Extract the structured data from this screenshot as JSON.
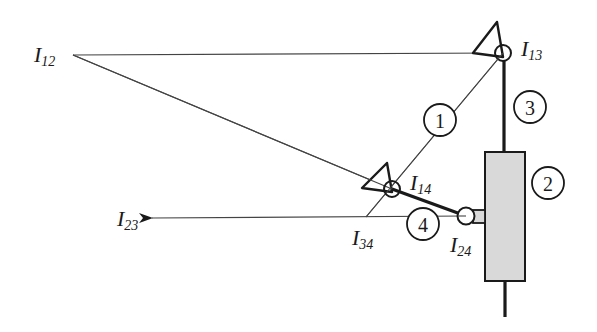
{
  "diagram": {
    "type": "slider-crank instant centers (Kennedy) diagram",
    "colors": {
      "stroke": "#1a1a1a",
      "thin_line": "#444444",
      "slider_fill": "#d9d9d9",
      "background": "#ffffff"
    },
    "instant_centers": [
      {
        "id": "I12",
        "main": "I",
        "sub": "12"
      },
      {
        "id": "I13",
        "main": "I",
        "sub": "13"
      },
      {
        "id": "I14",
        "main": "I",
        "sub": "14"
      },
      {
        "id": "I23",
        "main": "I",
        "sub": "23"
      },
      {
        "id": "I24",
        "main": "I",
        "sub": "24"
      },
      {
        "id": "I34",
        "main": "I",
        "sub": "34"
      }
    ],
    "links": [
      {
        "id": "1",
        "label": "1"
      },
      {
        "id": "2",
        "label": "2"
      },
      {
        "id": "3",
        "label": "3"
      },
      {
        "id": "4",
        "label": "4"
      }
    ]
  }
}
